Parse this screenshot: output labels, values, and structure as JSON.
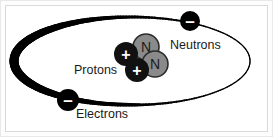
{
  "figure": {
    "background_color": "#ffffff",
    "frame_color": "#d9d9d9",
    "width": 273,
    "height": 137
  },
  "labels": {
    "neutrons": "Neutrons",
    "protons": "Protons",
    "electrons": "Electrons"
  },
  "orbit": {
    "name": "electron-orbit-ellipse",
    "color": "#000000",
    "center_x": 132,
    "center_y": 61,
    "radius_x": 118,
    "radius_y": 44,
    "stroke_min": 1.2,
    "stroke_max": 9.0
  },
  "particles": {
    "electrons": [
      {
        "symbol": "–",
        "cx": 190,
        "cy": 21,
        "r": 10,
        "fill": "#000000",
        "glyph_color": "#ffffff"
      },
      {
        "symbol": "–",
        "cx": 68,
        "cy": 100,
        "r": 11,
        "fill": "#000000",
        "glyph_color": "#ffffff"
      }
    ],
    "protons": [
      {
        "symbol": "+",
        "cx": 126,
        "cy": 54,
        "r": 12,
        "fill": "#111111",
        "glyph_color": "#ffffff"
      },
      {
        "symbol": "+",
        "cx": 137,
        "cy": 70,
        "r": 12,
        "fill": "#111111",
        "glyph_color": "#ffffff"
      }
    ],
    "neutrons": [
      {
        "symbol": "N",
        "cx": 146,
        "cy": 47,
        "r": 13,
        "fill": "#8a8a8a",
        "glyph_color": "#1a1a1a",
        "stroke": "#2b2b2b"
      },
      {
        "symbol": "N",
        "cx": 155,
        "cy": 64,
        "r": 13,
        "fill": "#8a8a8a",
        "glyph_color": "#1a1a1a",
        "stroke": "#2b2b2b"
      }
    ]
  },
  "leader_lines": [
    {
      "name": "electrons-leader-line",
      "x1": 78,
      "y1": 101,
      "x2": 140,
      "y2": 104,
      "color": "#000000"
    }
  ]
}
